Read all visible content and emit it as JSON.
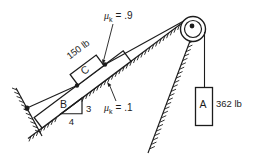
{
  "figure": {
    "block_b_label": "B",
    "block_c_label": "C",
    "block_a_label": "A",
    "weight_c": "150 lb",
    "weight_a": "362 lb",
    "mu_symbol": "μ",
    "mu_sub": "k",
    "mu_top_value": "= .9",
    "mu_bottom_value": "= .1",
    "slope_rise": "3",
    "slope_run": "4"
  },
  "colors": {
    "line": "#1c1c1c",
    "background": "#ffffff"
  }
}
